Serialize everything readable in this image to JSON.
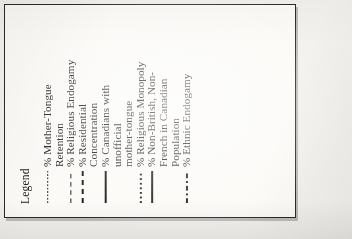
{
  "legend": {
    "title": "Legend",
    "entries": [
      {
        "line_style": "dotted-fine",
        "label": "% Mother-Tongue\nRetention"
      },
      {
        "line_style": "dashed",
        "label": "% Religious Endogamy"
      },
      {
        "line_style": "dash-heavy",
        "label": "% Residential\nConcentration"
      },
      {
        "line_style": "solid-thick",
        "label": "% Canadians with\nunofficial\nmother-tongue"
      },
      {
        "line_style": "dotted-square",
        "label": "% Religious Monopoly"
      },
      {
        "line_style": "solid-med",
        "label": "% Non-British, Non-\nFrench in Canadian\nPopulation"
      },
      {
        "line_style": "dash-dot",
        "label": "% Ethnic Endogamy"
      }
    ]
  },
  "style": {
    "ink": "#17171a",
    "paper": "#fbfaf7",
    "page": "#f2f1ed",
    "border": "#2a2a28"
  },
  "chart_data": {
    "type": "line",
    "title": "Legend",
    "xlabel": "",
    "ylabel": "",
    "legend_position": "standalone",
    "grid": false,
    "series": [
      {
        "name": "% Mother-Tongue Retention",
        "line_style": "dotted-fine",
        "color": "#17171a"
      },
      {
        "name": "% Religious Endogamy",
        "line_style": "dashed",
        "color": "#17171a"
      },
      {
        "name": "% Residential Concentration",
        "line_style": "dash-heavy",
        "color": "#121214"
      },
      {
        "name": "% Canadians with unofficial mother-tongue",
        "line_style": "solid-thick",
        "color": "#121214"
      },
      {
        "name": "% Religious Monopoly",
        "line_style": "dotted-square",
        "color": "#141416"
      },
      {
        "name": "% Non-British, Non-French in Canadian Population",
        "line_style": "solid-med",
        "color": "#16161a"
      },
      {
        "name": "% Ethnic Endogamy",
        "line_style": "dash-dot",
        "color": "#141416"
      }
    ]
  }
}
